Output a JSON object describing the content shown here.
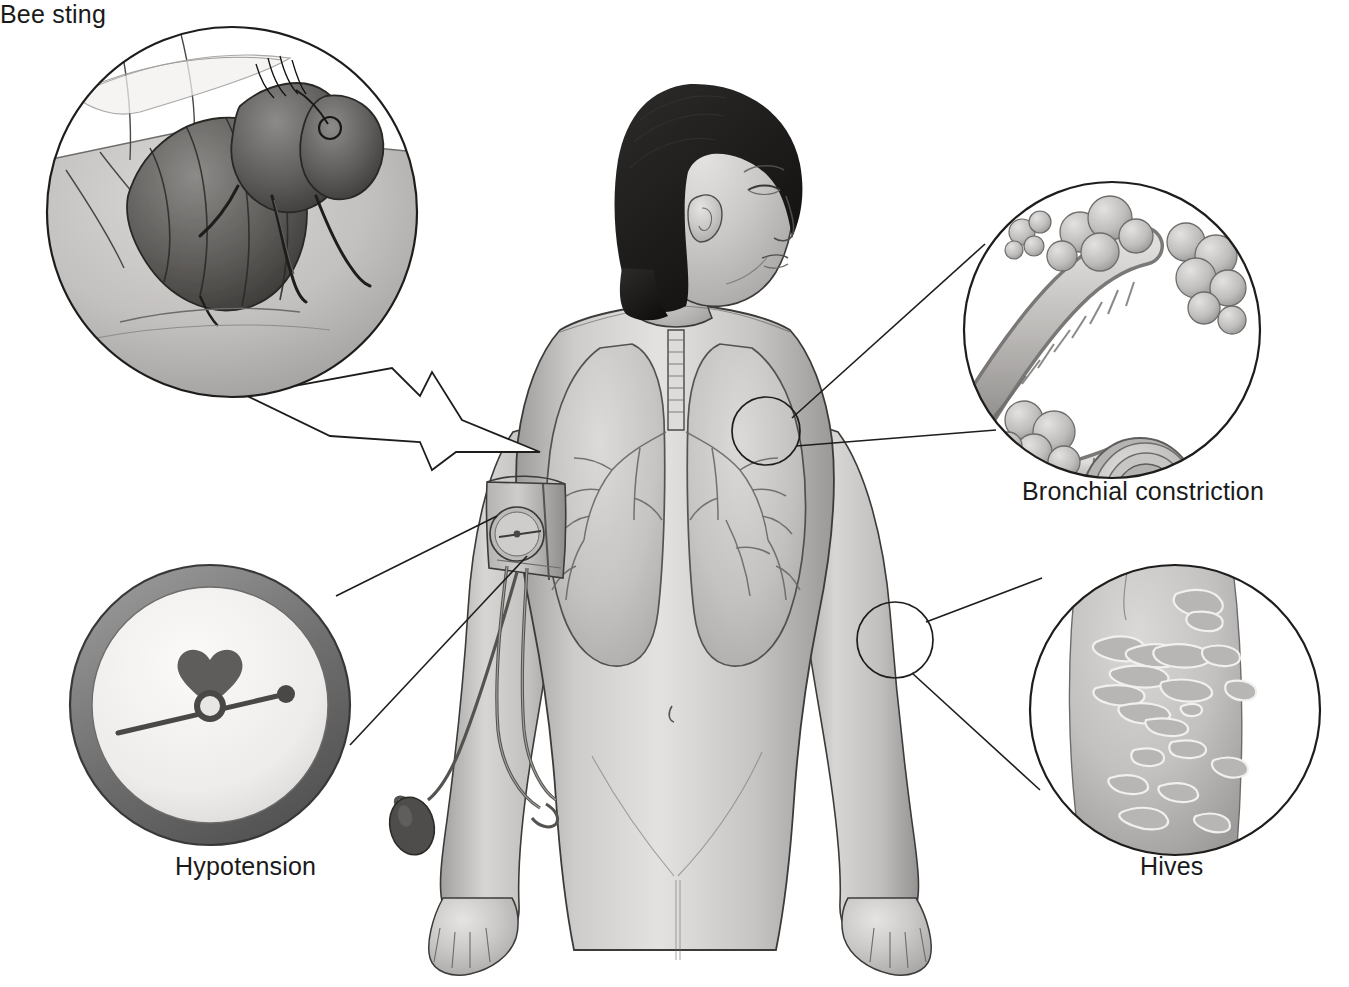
{
  "illustration": {
    "title": "Anaphylaxis symptoms medical illustration",
    "style": "grayscale pencil / airbrush medical art",
    "background_color": "#ffffff",
    "ink_color": "#1a1a1a"
  },
  "subject": {
    "name": "central-figure",
    "description": "Adult female torso, anterior view, head in right-facing profile with eyes closed, short dark bob hair, arms at sides with palms forward, lungs and bronchial tree visible through the chest, blood pressure cuff on her right upper arm",
    "hair_color": "#1f1f1f",
    "skin_tone": "#c9c9c9"
  },
  "callouts": [
    {
      "id": "bee-sting",
      "label": "Bee sting",
      "position": "top-left",
      "shape": "circle",
      "pointer": "jagged zig-zag banner arrow pointing to the shoulder",
      "contents": "Close-up of a honeybee on skin with stinger inserted, body hairs visible"
    },
    {
      "id": "bronchial-constriction",
      "label": "Bronchial constriction",
      "position": "right",
      "shape": "circle",
      "pointer": "two straight leader lines to a small circle on the left lung",
      "contents": "Ribbed bronchioles with grape-like alveolar clusters and a cut cross-section showing a narrowed star-shaped lumen"
    },
    {
      "id": "hypotension",
      "label": "Hypotension",
      "position": "bottom-left",
      "shape": "circle",
      "pointer": "two straight leader lines to the cuff gauge on the upper arm",
      "contents": "Sphygmomanometer dial with heart symbol, needle resting low near 80"
    },
    {
      "id": "hives",
      "label": "Hives",
      "position": "bottom-right",
      "shape": "circle",
      "pointer": "two straight leader lines to a small circle on the forearm",
      "contents": "Close-up of skin covered in raised urticarial welts / wheals"
    }
  ],
  "gauge": {
    "name": "blood-pressure-dial",
    "units": "mmHg",
    "tick_labels": [
      "20",
      "40",
      "60",
      "80",
      "100",
      "120",
      "140",
      "160",
      "180",
      "200",
      "220",
      "240",
      "260",
      "280",
      "300"
    ],
    "major_interval": 20,
    "minor_ticks_per_major": 4,
    "needle_value": 80,
    "center_symbol": "heart-icon",
    "bezel_color": "#7d7d7d",
    "face_color": "#f2f0ee",
    "numeral_color": "#4a4a4a",
    "needle_color": "#4a4a4a"
  },
  "equipment": {
    "name": "sphygmomanometer",
    "parts": [
      "arm-cuff",
      "cuff-dial",
      "rubber-tubing",
      "inflation-bulb"
    ]
  }
}
